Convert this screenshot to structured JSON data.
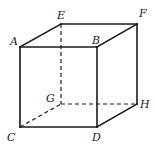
{
  "diagram": {
    "vertices": {
      "A": {
        "label": "A",
        "x": 20,
        "y": 47
      },
      "B": {
        "label": "B",
        "x": 97,
        "y": 47
      },
      "C": {
        "label": "C",
        "x": 20,
        "y": 127
      },
      "D": {
        "label": "D",
        "x": 97,
        "y": 127
      },
      "E": {
        "label": "E",
        "x": 61,
        "y": 24
      },
      "F": {
        "label": "F",
        "x": 137,
        "y": 24
      },
      "G": {
        "label": "G",
        "x": 61,
        "y": 104
      },
      "H": {
        "label": "H",
        "x": 137,
        "y": 104
      }
    },
    "visible_edges": [
      "AB",
      "AC",
      "BD",
      "CD",
      "AE",
      "EF",
      "BF",
      "FH",
      "DH"
    ],
    "hidden_edges": [
      "EG",
      "CG",
      "GH"
    ],
    "labels": {
      "A": "A",
      "B": "B",
      "C": "C",
      "D": "D",
      "E": "E",
      "F": "F",
      "G": "G",
      "H": "H"
    }
  }
}
